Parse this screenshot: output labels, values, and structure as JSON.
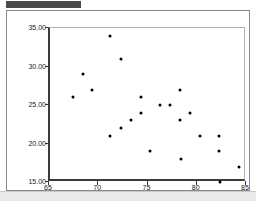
{
  "chart_data": {
    "type": "scatter",
    "title": "",
    "xlabel": "X Value",
    "ylabel": "",
    "xlim": [
      65,
      85
    ],
    "ylim": [
      15.0,
      35.0
    ],
    "grid": false,
    "legend": null,
    "xticks": [
      "65",
      "70",
      "75",
      "80",
      "85"
    ],
    "xtick_values": [
      65,
      70,
      75,
      80,
      85
    ],
    "yticks": [
      "35.00",
      "30.00",
      "25.00",
      "20.00",
      "15.00"
    ],
    "ytick_values": [
      35.0,
      30.0,
      25.0,
      20.0,
      15.0
    ],
    "marker": "filled-circle",
    "marker_color": "#000000",
    "points": [
      {
        "x": 67.3,
        "y": 26.0
      },
      {
        "x": 68.3,
        "y": 29.0
      },
      {
        "x": 69.3,
        "y": 27.0
      },
      {
        "x": 71.1,
        "y": 34.0
      },
      {
        "x": 71.1,
        "y": 21.0
      },
      {
        "x": 72.2,
        "y": 31.0
      },
      {
        "x": 72.2,
        "y": 22.0
      },
      {
        "x": 73.2,
        "y": 23.0
      },
      {
        "x": 74.2,
        "y": 26.0
      },
      {
        "x": 74.2,
        "y": 24.0
      },
      {
        "x": 75.2,
        "y": 19.0
      },
      {
        "x": 76.2,
        "y": 25.0
      },
      {
        "x": 77.2,
        "y": 25.0
      },
      {
        "x": 78.2,
        "y": 27.0
      },
      {
        "x": 78.2,
        "y": 23.0
      },
      {
        "x": 78.3,
        "y": 18.0
      },
      {
        "x": 79.2,
        "y": 24.0
      },
      {
        "x": 80.2,
        "y": 21.0
      },
      {
        "x": 82.2,
        "y": 21.0
      },
      {
        "x": 82.2,
        "y": 19.0
      },
      {
        "x": 82.3,
        "y": 15.0
      },
      {
        "x": 84.2,
        "y": 17.0
      }
    ]
  },
  "axes": {
    "frame_color": "#3b3b3b",
    "background": "#ffffff"
  },
  "header": {
    "bar_color": "#4a4a4a"
  }
}
